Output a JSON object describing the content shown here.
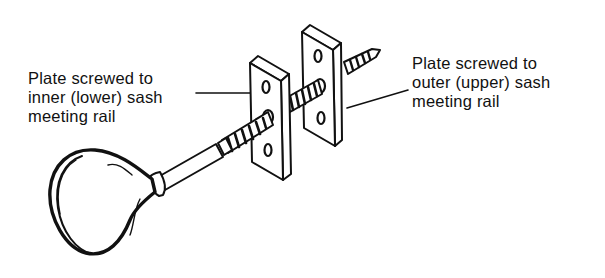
{
  "diagram": {
    "labels": {
      "left": {
        "lines": [
          "Plate screwed to",
          "inner (lower) sash",
          "meeting rail"
        ]
      },
      "right": {
        "lines": [
          "Plate screwed to",
          "outer (upper) sash",
          "meeting rail"
        ]
      }
    },
    "colors": {
      "ink": "#111111",
      "background": "#ffffff"
    }
  }
}
